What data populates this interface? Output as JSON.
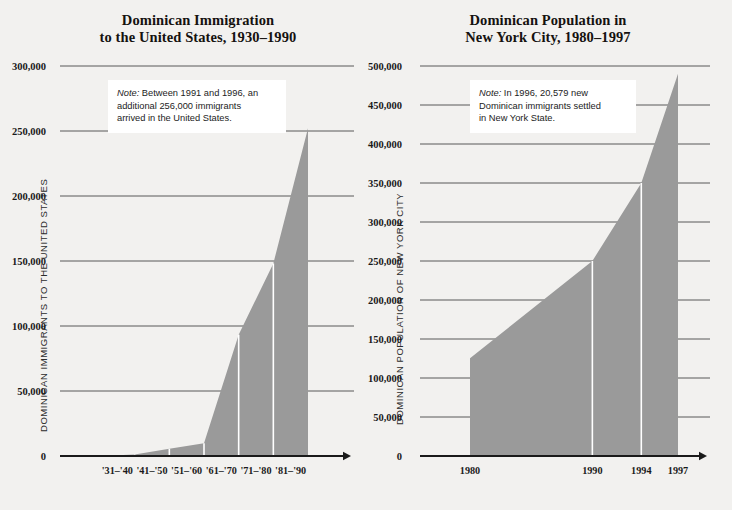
{
  "figure": {
    "background_color": "#f2f1ef",
    "area_fill_color": "#9a9a9a",
    "axis_color": "#1a1a1a",
    "gridline_color": "#595959",
    "note_background": "#ffffff"
  },
  "chart_data": [
    {
      "type": "area",
      "id": "dominican-immigration-us",
      "title": "Dominican Immigration\nto the United States, 1930–1990",
      "title_line1": "Dominican Immigration",
      "title_line2": "to the United States, 1930–1990",
      "ylabel": "DOMINICAN IMMIGRANTS TO THE UNITED STATES",
      "xlabel": "",
      "categories": [
        "'31–'40",
        "'41–'50",
        "'51–'60",
        "'61–'70",
        "'71–'80",
        "'81–'90"
      ],
      "values": [
        1150,
        5627,
        9897,
        93292,
        148135,
        252035
      ],
      "ylim": [
        0,
        300000
      ],
      "yticks": [
        0,
        50000,
        100000,
        150000,
        200000,
        250000,
        300000
      ],
      "ytick_labels": [
        "0",
        "50,000",
        "100,000",
        "150,000",
        "200,000",
        "250,000",
        "300,000"
      ],
      "grid": true,
      "legend": "none",
      "note": "Note: Between 1991 and 1996, an additional 256,000 immigrants arrived in the United States.",
      "note_lines": [
        "Note: Between 1991 and 1996, an",
        "additional 256,000 immigrants",
        "arrived in the United States."
      ],
      "note_label": "Note:"
    },
    {
      "type": "area",
      "id": "dominican-population-nyc",
      "title": "Dominican Population in\nNew York City, 1980–1997",
      "title_line1": "Dominican Population in",
      "title_line2": "New York City, 1980–1997",
      "ylabel": "DOMINICAN POPULATION OF NEW YORK CITY",
      "xlabel": "",
      "x": [
        1980,
        1990,
        1994,
        1997
      ],
      "categories": [
        "1980",
        "1990",
        "1994",
        "1997"
      ],
      "values": [
        125380,
        250000,
        350000,
        490000
      ],
      "ylim": [
        0,
        500000
      ],
      "yticks": [
        0,
        50000,
        100000,
        150000,
        200000,
        250000,
        300000,
        350000,
        400000,
        450000,
        500000
      ],
      "ytick_labels": [
        "0",
        "50,000",
        "100,000",
        "150,000",
        "200,000",
        "250,000",
        "300,000",
        "350,000",
        "400,000",
        "450,000",
        "500,000"
      ],
      "grid": true,
      "legend": "none",
      "note": "Note: In 1996, 20,579 new Dominican immigrants settled in New York State.",
      "note_lines": [
        "Note: In 1996, 20,579 new",
        "Dominican immigrants settled",
        "in New York State."
      ],
      "note_label": "Note:"
    }
  ]
}
